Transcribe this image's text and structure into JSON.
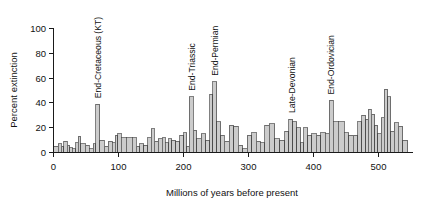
{
  "figure": {
    "background": "#ffffff",
    "bar_fill": "#cccccc",
    "bar_stroke": "#3c3c3c",
    "axis_color": "#1a1a1a"
  },
  "chart_data": {
    "type": "bar",
    "title": "",
    "subtitle": "",
    "xlabel": "Millions of years before present",
    "ylabel": "Percent extinction",
    "xlim": [
      0,
      550
    ],
    "ylim": [
      0,
      100
    ],
    "xticks": [
      0,
      100,
      200,
      300,
      400,
      500
    ],
    "xticklabels": [
      "0",
      "100",
      "200",
      "300",
      "400",
      "500"
    ],
    "yticks": [
      0,
      20,
      40,
      60,
      80,
      100
    ],
    "yticklabels": [
      "0",
      "20",
      "40",
      "60",
      "80",
      "100"
    ],
    "grid": false,
    "legend": null,
    "x_axis_direction": "increasing-left-to-right",
    "bar_edges_note": "Bars are geologic stages of unequal width spanning 0-545 Myr",
    "bars": [
      {
        "x0": 0,
        "x1": 7,
        "value": 5
      },
      {
        "x0": 7,
        "x1": 12,
        "value": 7
      },
      {
        "x0": 12,
        "x1": 16,
        "value": 5
      },
      {
        "x0": 16,
        "x1": 21,
        "value": 9
      },
      {
        "x0": 21,
        "x1": 25,
        "value": 6
      },
      {
        "x0": 25,
        "x1": 29,
        "value": 4
      },
      {
        "x0": 29,
        "x1": 34,
        "value": 3
      },
      {
        "x0": 34,
        "x1": 38,
        "value": 8
      },
      {
        "x0": 38,
        "x1": 42,
        "value": 13
      },
      {
        "x0": 42,
        "x1": 49,
        "value": 7
      },
      {
        "x0": 49,
        "x1": 55,
        "value": 6
      },
      {
        "x0": 55,
        "x1": 61,
        "value": 3
      },
      {
        "x0": 61,
        "x1": 65,
        "value": 7
      },
      {
        "x0": 65,
        "x1": 71,
        "value": 39
      },
      {
        "x0": 71,
        "x1": 78,
        "value": 10
      },
      {
        "x0": 78,
        "x1": 84,
        "value": 5
      },
      {
        "x0": 84,
        "x1": 90,
        "value": 9
      },
      {
        "x0": 90,
        "x1": 95,
        "value": 8
      },
      {
        "x0": 95,
        "x1": 99,
        "value": 14
      },
      {
        "x0": 99,
        "x1": 104,
        "value": 15
      },
      {
        "x0": 104,
        "x1": 112,
        "value": 12
      },
      {
        "x0": 112,
        "x1": 121,
        "value": 12
      },
      {
        "x0": 121,
        "x1": 127,
        "value": 12
      },
      {
        "x0": 127,
        "x1": 133,
        "value": 5
      },
      {
        "x0": 133,
        "x1": 139,
        "value": 7
      },
      {
        "x0": 139,
        "x1": 145,
        "value": 6
      },
      {
        "x0": 145,
        "x1": 150,
        "value": 12
      },
      {
        "x0": 150,
        "x1": 155,
        "value": 19
      },
      {
        "x0": 155,
        "x1": 161,
        "value": 9
      },
      {
        "x0": 161,
        "x1": 167,
        "value": 11
      },
      {
        "x0": 167,
        "x1": 172,
        "value": 12
      },
      {
        "x0": 172,
        "x1": 177,
        "value": 8
      },
      {
        "x0": 177,
        "x1": 182,
        "value": 11
      },
      {
        "x0": 182,
        "x1": 188,
        "value": 10
      },
      {
        "x0": 188,
        "x1": 194,
        "value": 9
      },
      {
        "x0": 194,
        "x1": 200,
        "value": 14
      },
      {
        "x0": 200,
        "x1": 205,
        "value": 16
      },
      {
        "x0": 205,
        "x1": 209,
        "value": 5
      },
      {
        "x0": 209,
        "x1": 215,
        "value": 45
      },
      {
        "x0": 215,
        "x1": 220,
        "value": 18
      },
      {
        "x0": 220,
        "x1": 227,
        "value": 11
      },
      {
        "x0": 227,
        "x1": 234,
        "value": 15
      },
      {
        "x0": 234,
        "x1": 240,
        "value": 10
      },
      {
        "x0": 240,
        "x1": 245,
        "value": 47
      },
      {
        "x0": 245,
        "x1": 251,
        "value": 57
      },
      {
        "x0": 251,
        "x1": 257,
        "value": 25
      },
      {
        "x0": 257,
        "x1": 263,
        "value": 14
      },
      {
        "x0": 263,
        "x1": 270,
        "value": 9
      },
      {
        "x0": 270,
        "x1": 277,
        "value": 22
      },
      {
        "x0": 277,
        "x1": 284,
        "value": 21
      },
      {
        "x0": 284,
        "x1": 291,
        "value": 6
      },
      {
        "x0": 291,
        "x1": 298,
        "value": 3
      },
      {
        "x0": 298,
        "x1": 305,
        "value": 14
      },
      {
        "x0": 305,
        "x1": 312,
        "value": 16
      },
      {
        "x0": 312,
        "x1": 318,
        "value": 9
      },
      {
        "x0": 318,
        "x1": 325,
        "value": 8
      },
      {
        "x0": 325,
        "x1": 332,
        "value": 22
      },
      {
        "x0": 332,
        "x1": 340,
        "value": 23
      },
      {
        "x0": 340,
        "x1": 348,
        "value": 11
      },
      {
        "x0": 348,
        "x1": 356,
        "value": 10
      },
      {
        "x0": 356,
        "x1": 362,
        "value": 17
      },
      {
        "x0": 362,
        "x1": 368,
        "value": 27
      },
      {
        "x0": 368,
        "x1": 374,
        "value": 25
      },
      {
        "x0": 374,
        "x1": 380,
        "value": 20
      },
      {
        "x0": 380,
        "x1": 385,
        "value": 8
      },
      {
        "x0": 385,
        "x1": 391,
        "value": 20
      },
      {
        "x0": 391,
        "x1": 397,
        "value": 14
      },
      {
        "x0": 397,
        "x1": 404,
        "value": 15
      },
      {
        "x0": 404,
        "x1": 411,
        "value": 14
      },
      {
        "x0": 411,
        "x1": 418,
        "value": 16
      },
      {
        "x0": 418,
        "x1": 424,
        "value": 15
      },
      {
        "x0": 424,
        "x1": 430,
        "value": 42
      },
      {
        "x0": 430,
        "x1": 438,
        "value": 25
      },
      {
        "x0": 438,
        "x1": 447,
        "value": 25
      },
      {
        "x0": 447,
        "x1": 454,
        "value": 16
      },
      {
        "x0": 454,
        "x1": 461,
        "value": 14
      },
      {
        "x0": 461,
        "x1": 468,
        "value": 14
      },
      {
        "x0": 468,
        "x1": 474,
        "value": 25
      },
      {
        "x0": 474,
        "x1": 480,
        "value": 30
      },
      {
        "x0": 480,
        "x1": 484,
        "value": 27
      },
      {
        "x0": 484,
        "x1": 489,
        "value": 35
      },
      {
        "x0": 489,
        "x1": 494,
        "value": 31
      },
      {
        "x0": 494,
        "x1": 499,
        "value": 22
      },
      {
        "x0": 499,
        "x1": 504,
        "value": 15
      },
      {
        "x0": 504,
        "x1": 509,
        "value": 28
      },
      {
        "x0": 509,
        "x1": 514,
        "value": 51
      },
      {
        "x0": 514,
        "x1": 519,
        "value": 45
      },
      {
        "x0": 519,
        "x1": 524,
        "value": 17
      },
      {
        "x0": 524,
        "x1": 530,
        "value": 24
      },
      {
        "x0": 530,
        "x1": 537,
        "value": 21
      },
      {
        "x0": 537,
        "x1": 545,
        "value": 10
      }
    ],
    "annotations": [
      {
        "label": "End-Cretaceous (KT)",
        "x": 68
      },
      {
        "label": "End-Triassic",
        "x": 212
      },
      {
        "label": "End-Permian",
        "x": 248
      },
      {
        "label": "Late-Devonian",
        "x": 366
      },
      {
        "label": "End-Ordovician",
        "x": 427
      }
    ]
  }
}
